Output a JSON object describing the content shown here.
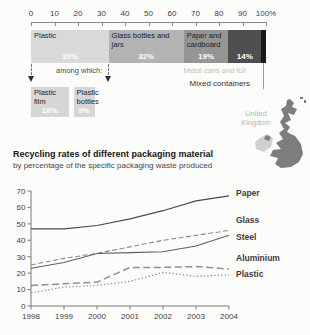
{
  "map": {
    "country": "United Kingdom"
  },
  "chart_data": [
    {
      "type": "bar",
      "variant": "stacked-horizontal-100pct",
      "unit": "%",
      "axis_ticks": [
        0,
        10,
        20,
        30,
        40,
        50,
        60,
        70,
        80,
        90,
        100
      ],
      "categories": [
        "Plastic",
        "Glass bottles and jars",
        "Paper and cardboard",
        "Metal cans and foil",
        "Mixed containers"
      ],
      "values": [
        33,
        32,
        19,
        14,
        2
      ],
      "colors": [
        "#d9d9d9",
        "#b3b3b3",
        "#959595",
        "#4f4f4f",
        "#1a1a1a"
      ],
      "label_inside": [
        true,
        true,
        true,
        false,
        false
      ],
      "pct_inside": [
        true,
        true,
        true,
        true,
        false
      ],
      "sub_breakdown": {
        "caption": "among which:",
        "of": "Plastic",
        "categories": [
          "Plastic film",
          "Plastic bottles"
        ],
        "values": [
          16,
          9
        ],
        "color": "#d6d6d6"
      }
    },
    {
      "type": "line",
      "title": "Recycling rates of different packaging material",
      "subtitle": "by percentage of the specific packaging waste produced",
      "x": [
        1998,
        1999,
        2000,
        2001,
        2002,
        2003,
        2004
      ],
      "ylim": [
        0,
        70
      ],
      "yticks": [
        0,
        10,
        20,
        30,
        40,
        50,
        60,
        70
      ],
      "grid": false,
      "legend_position": "labels-right-of-lines",
      "series": [
        {
          "name": "Paper",
          "values": [
            47,
            47,
            49,
            53,
            58,
            64,
            67
          ],
          "stroke": "#4a4a4a",
          "dash": "",
          "width": 1.2
        },
        {
          "name": "Glass",
          "values": [
            25,
            29,
            32,
            36,
            40,
            43,
            46
          ],
          "stroke": "#8a8a8a",
          "dash": "5,2.5",
          "width": 1.1
        },
        {
          "name": "Steel",
          "values": [
            23,
            26.5,
            32,
            32.5,
            33,
            36.5,
            43
          ],
          "stroke": "#5f5f5f",
          "dash": "",
          "width": 1.1
        },
        {
          "name": "Aluminium",
          "values": [
            12.5,
            13.5,
            14.5,
            23.5,
            23.5,
            24,
            22.5
          ],
          "stroke": "#8f8f8f",
          "dash": "7,3.5",
          "width": 1.5
        },
        {
          "name": "Plastic",
          "values": [
            8,
            11.5,
            12.5,
            15,
            20.5,
            18,
            19
          ],
          "stroke": "#8a8a8a",
          "dash": "1.3,2.2",
          "width": 1.2
        }
      ]
    }
  ]
}
